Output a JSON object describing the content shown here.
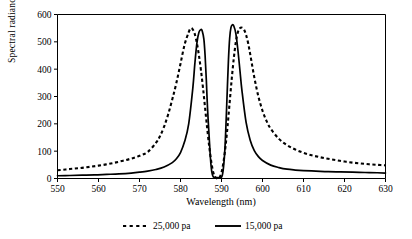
{
  "chart_data": {
    "type": "line",
    "title": "",
    "xlabel": "Wavelength (nm)",
    "ylabel": "Spectral radiance",
    "xlim": [
      550,
      630
    ],
    "ylim": [
      0,
      600
    ],
    "xticks": [
      550,
      560,
      570,
      580,
      590,
      600,
      610,
      620,
      630
    ],
    "yticks": [
      0,
      100,
      200,
      300,
      400,
      500,
      600
    ],
    "grid": false,
    "legend_position": "bottom",
    "series": [
      {
        "name": "25,000 pa",
        "style": "dashed",
        "color": "#000000",
        "x": [
          550,
          552,
          554,
          556,
          558,
          560,
          562,
          564,
          566,
          568,
          570,
          572,
          574,
          575,
          576,
          577,
          578,
          579,
          580,
          581,
          582,
          582.5,
          583,
          583.5,
          584,
          584.5,
          585,
          585.5,
          586,
          586.5,
          587,
          587.5,
          588,
          588.5,
          589,
          589.5,
          590,
          590.5,
          591,
          591.5,
          592,
          592.5,
          593,
          593.5,
          594,
          594.5,
          595,
          595.5,
          596,
          596.5,
          597,
          598,
          599,
          600,
          601,
          602,
          604,
          606,
          608,
          610,
          612,
          614,
          616,
          618,
          620,
          622,
          624,
          626,
          628,
          630
        ],
        "y": [
          30,
          33,
          36,
          39,
          43,
          47,
          52,
          58,
          65,
          73,
          83,
          97,
          130,
          155,
          190,
          235,
          290,
          350,
          420,
          490,
          535,
          550,
          545,
          528,
          495,
          450,
          395,
          330,
          258,
          185,
          118,
          62,
          22,
          4,
          0,
          4,
          22,
          62,
          120,
          195,
          280,
          365,
          440,
          500,
          535,
          550,
          552,
          545,
          525,
          495,
          455,
          370,
          300,
          248,
          210,
          182,
          145,
          122,
          106,
          94,
          85,
          78,
          72,
          67,
          62,
          58,
          55,
          52,
          50,
          48
        ]
      },
      {
        "name": "15,000 pa",
        "style": "solid",
        "color": "#000000",
        "x": [
          550,
          553,
          556,
          559,
          562,
          565,
          568,
          570,
          572,
          574,
          576,
          578,
          579,
          580,
          581,
          582,
          583,
          583.5,
          584,
          584.5,
          585,
          585.3,
          585.7,
          586,
          586.3,
          586.6,
          587,
          587.3,
          587.6,
          588,
          589,
          590,
          590.4,
          590.8,
          591.1,
          591.4,
          591.7,
          592,
          592.3,
          592.6,
          593,
          593.5,
          594,
          594.5,
          595,
          596,
          597,
          598,
          599,
          600,
          602,
          604,
          606,
          608,
          610,
          613,
          616,
          619,
          622,
          625,
          628,
          630
        ],
        "y": [
          10,
          11,
          12,
          13,
          15,
          17,
          20,
          23,
          27,
          33,
          42,
          58,
          72,
          95,
          135,
          200,
          330,
          420,
          495,
          535,
          545,
          540,
          510,
          450,
          360,
          255,
          150,
          75,
          28,
          6,
          3,
          5,
          30,
          100,
          200,
          320,
          435,
          515,
          552,
          562,
          558,
          530,
          470,
          395,
          320,
          205,
          140,
          102,
          80,
          66,
          49,
          40,
          34,
          31,
          29,
          27,
          25,
          24,
          23,
          22,
          21,
          20
        ]
      }
    ]
  },
  "legend": {
    "items": [
      {
        "label": "25,000 pa",
        "style": "dashed"
      },
      {
        "label": "15,000 pa",
        "style": "solid"
      }
    ]
  }
}
